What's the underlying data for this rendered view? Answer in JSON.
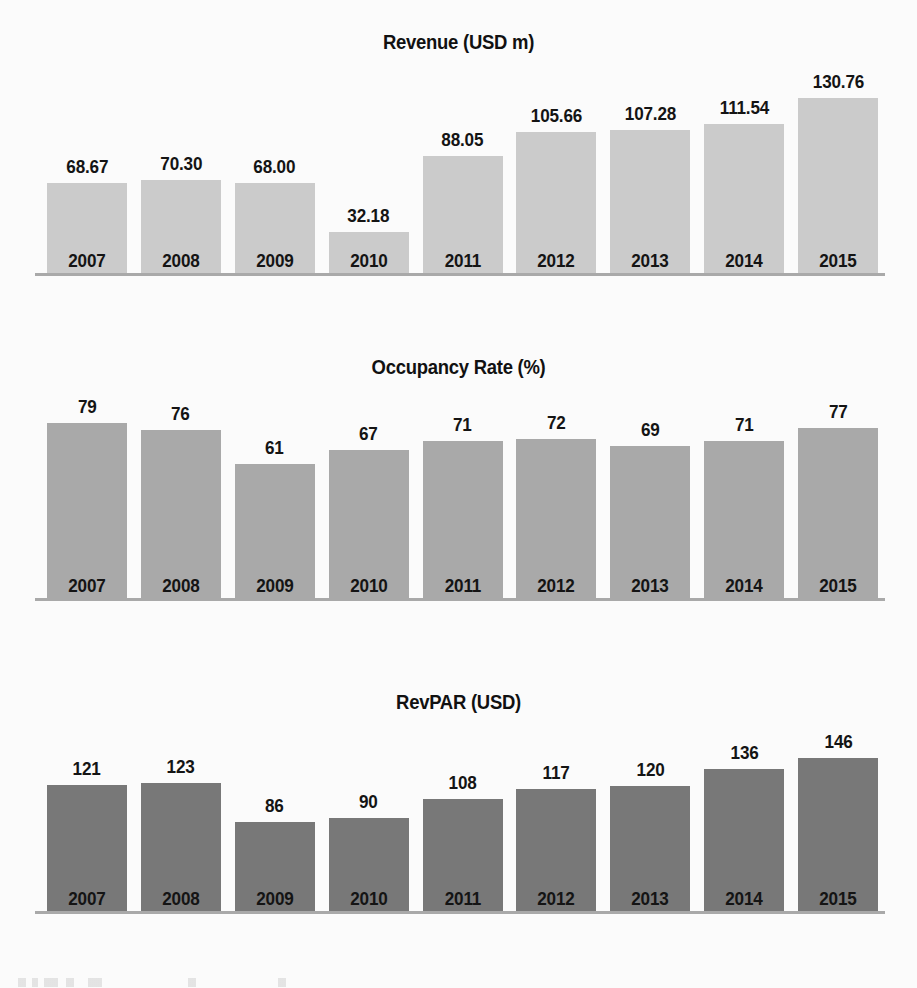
{
  "page": {
    "background_color": "#fbfbfb",
    "text_color": "#141414"
  },
  "charts": [
    {
      "id": "revenue",
      "title": "Revenue (USD m)",
      "bar_color": "#cbcbcb",
      "axis_color": "#a9a9a9"
    },
    {
      "id": "occupancy",
      "title": "Occupancy Rate (%)",
      "bar_color": "#a9a9a9",
      "axis_color": "#a9a9a9"
    },
    {
      "id": "revpar",
      "title": "RevPAR (USD)",
      "bar_color": "#787878",
      "axis_color": "#a9a9a9"
    }
  ],
  "chart_data": [
    {
      "type": "bar",
      "title": "Revenue (USD m)",
      "xlabel": "",
      "ylabel": "Revenue (USD m)",
      "categories": [
        "2007",
        "2008",
        "2009",
        "2010",
        "2011",
        "2012",
        "2013",
        "2014",
        "2015"
      ],
      "values": [
        68.67,
        70.3,
        68.0,
        32.18,
        88.05,
        105.66,
        107.28,
        111.54,
        130.76
      ],
      "labels": [
        "68.67",
        "70.30",
        "68.00",
        "32.18",
        "88.05",
        "105.66",
        "107.28",
        "111.54",
        "130.76"
      ],
      "ylim": [
        0,
        130.76
      ],
      "grid": false,
      "legend": "none",
      "data_labels": "above-bar",
      "series_color": "#cbcbcb"
    },
    {
      "type": "bar",
      "title": "Occupancy Rate (%)",
      "xlabel": "",
      "ylabel": "Occupancy Rate (%)",
      "categories": [
        "2007",
        "2008",
        "2009",
        "2010",
        "2011",
        "2012",
        "2013",
        "2014",
        "2015"
      ],
      "values": [
        79,
        76,
        61,
        67,
        71,
        72,
        69,
        71,
        77
      ],
      "labels": [
        "79",
        "76",
        "61",
        "67",
        "71",
        "72",
        "69",
        "71",
        "77"
      ],
      "ylim": [
        0,
        79
      ],
      "grid": false,
      "legend": "none",
      "data_labels": "above-bar",
      "series_color": "#a9a9a9"
    },
    {
      "type": "bar",
      "title": "RevPAR (USD)",
      "xlabel": "",
      "ylabel": "RevPAR (USD)",
      "categories": [
        "2007",
        "2008",
        "2009",
        "2010",
        "2011",
        "2012",
        "2013",
        "2014",
        "2015"
      ],
      "values": [
        121,
        123,
        86,
        90,
        108,
        117,
        120,
        136,
        146
      ],
      "labels": [
        "121",
        "123",
        "86",
        "90",
        "108",
        "117",
        "120",
        "136",
        "146"
      ],
      "ylim": [
        0,
        146
      ],
      "grid": false,
      "legend": "none",
      "data_labels": "above-bar",
      "series_color": "#787878"
    }
  ]
}
